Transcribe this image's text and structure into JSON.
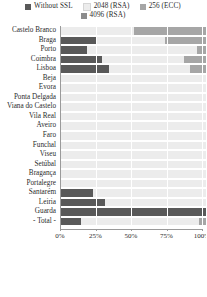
{
  "chart_data": {
    "type": "bar",
    "orientation": "horizontal",
    "stacked": true,
    "title": "",
    "xlabel": "",
    "ylabel": "",
    "xlim": [
      0,
      100
    ],
    "xtick_labels": [
      "0%",
      "25%",
      "50%",
      "75%",
      "100%"
    ],
    "xtick_values": [
      0,
      25,
      50,
      75,
      100
    ],
    "grid": true,
    "legend_position": "top",
    "categories": [
      "Castelo Branco",
      "Braga",
      "Porto",
      "Coimbra",
      "Lisboa",
      "Beja",
      "Évora",
      "Ponta Delgada",
      "Viana do Castelo",
      "Vila Real",
      "Aveiro",
      "Faro",
      "Funchal",
      "Viseu",
      "Setúbal",
      "Bragança",
      "Portalegre",
      "Santarém",
      "Leiria",
      "Guarda",
      "- Total -"
    ],
    "series": [
      {
        "name": "Without SSL",
        "color": "#595959",
        "values": [
          0,
          25,
          18,
          28,
          33,
          0,
          0,
          0,
          0,
          0,
          0,
          0,
          0,
          0,
          0,
          0,
          0,
          22,
          30,
          100,
          14
        ]
      },
      {
        "name": "2048 (RSA)",
        "color": "#ececec",
        "values": [
          50,
          47,
          76,
          57,
          56,
          100,
          100,
          100,
          100,
          100,
          100,
          100,
          100,
          100,
          100,
          100,
          100,
          78,
          70,
          0,
          81
        ]
      },
      {
        "name": "256 (ECC)",
        "color": "#a6a6a6",
        "values": [
          50,
          28,
          6,
          15,
          11,
          0,
          0,
          0,
          0,
          0,
          0,
          0,
          0,
          0,
          0,
          0,
          0,
          0,
          0,
          0,
          5
        ]
      },
      {
        "name": "4096 (RSA)",
        "color": "#8c8c8c",
        "values": [
          0,
          0,
          0,
          0,
          0,
          0,
          0,
          0,
          0,
          0,
          0,
          0,
          0,
          0,
          0,
          0,
          0,
          0,
          0,
          0,
          0
        ]
      }
    ]
  },
  "legend": {
    "items": [
      {
        "label": "Without SSL",
        "color": "#595959"
      },
      {
        "label": "2048 (RSA)",
        "color": "#ececec"
      },
      {
        "label": "256 (ECC)",
        "color": "#a6a6a6"
      },
      {
        "label": "4096 (RSA)",
        "color": "#8c8c8c"
      }
    ]
  },
  "colors": {
    "background": "#ffffff",
    "track": "#ececec",
    "axis": "#9a9a9a",
    "gridline": "#ffffff",
    "text": "#2b2b2b"
  }
}
